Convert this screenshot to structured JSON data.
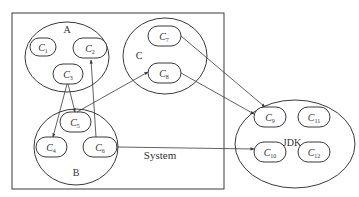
{
  "system": {
    "label": "System"
  },
  "groups": {
    "A": {
      "label": "A",
      "components": [
        {
          "name": "C",
          "sub": "1"
        },
        {
          "name": "C",
          "sub": "2"
        },
        {
          "name": "C",
          "sub": "3"
        }
      ]
    },
    "B": {
      "label": "B",
      "components": [
        {
          "name": "C",
          "sub": "4"
        },
        {
          "name": "C",
          "sub": "5"
        },
        {
          "name": "C",
          "sub": "6"
        }
      ]
    },
    "C": {
      "label": "C",
      "components": [
        {
          "name": "C",
          "sub": "7"
        },
        {
          "name": "C",
          "sub": "8"
        }
      ]
    },
    "JDK": {
      "label": "JDK",
      "components": [
        {
          "name": "C",
          "sub": "9"
        },
        {
          "name": "C",
          "sub": "11"
        },
        {
          "name": "C",
          "sub": "10"
        },
        {
          "name": "C",
          "sub": "12"
        }
      ]
    }
  },
  "edges": [
    {
      "from": "C3",
      "to": "C4"
    },
    {
      "from": "C3",
      "to": "C5"
    },
    {
      "from": "C6",
      "to": "C2"
    },
    {
      "from": "C5",
      "to": "C8"
    },
    {
      "from": "C7",
      "to": "C9"
    },
    {
      "from": "C8",
      "to": "C9"
    },
    {
      "from": "C6",
      "to": "C10"
    }
  ],
  "colors": {
    "stroke": "#3a3a3a",
    "background": "#ffffff"
  }
}
